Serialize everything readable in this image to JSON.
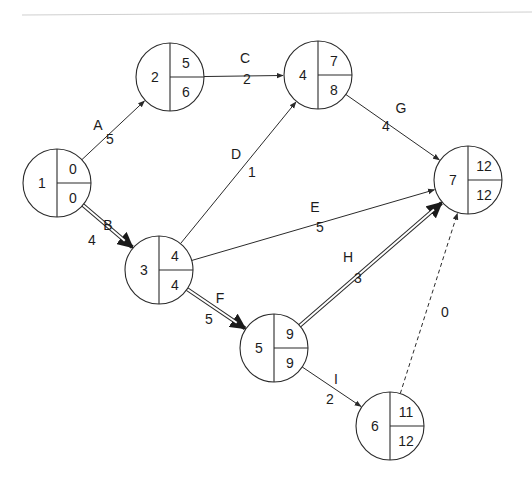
{
  "diagram": {
    "type": "activity-on-arrow network (critical path)",
    "colors": {
      "line": "#2a2a2a",
      "background": "#ffffff",
      "rule": "#cfcfcf"
    },
    "nodes": [
      {
        "id": "1",
        "label": "1",
        "earliest": "0",
        "latest": "0",
        "cx": 57,
        "cy": 183
      },
      {
        "id": "2",
        "label": "2",
        "earliest": "5",
        "latest": "6",
        "cx": 170,
        "cy": 77
      },
      {
        "id": "3",
        "label": "3",
        "earliest": "4",
        "latest": "4",
        "cx": 159,
        "cy": 270
      },
      {
        "id": "4",
        "label": "4",
        "earliest": "7",
        "latest": "8",
        "cx": 318,
        "cy": 75
      },
      {
        "id": "5",
        "label": "5",
        "earliest": "9",
        "latest": "9",
        "cx": 274,
        "cy": 348
      },
      {
        "id": "6",
        "label": "6",
        "earliest": "11",
        "latest": "12",
        "cx": 390,
        "cy": 426
      },
      {
        "id": "7",
        "label": "7",
        "earliest": "12",
        "latest": "12",
        "cx": 468,
        "cy": 180
      }
    ],
    "edges": [
      {
        "activity": "A",
        "duration": "5",
        "from": "1",
        "to": "2",
        "style": "normal"
      },
      {
        "activity": "B",
        "duration": "4",
        "from": "1",
        "to": "3",
        "style": "critical"
      },
      {
        "activity": "C",
        "duration": "2",
        "from": "2",
        "to": "4",
        "style": "normal"
      },
      {
        "activity": "D",
        "duration": "1",
        "from": "3",
        "to": "4",
        "style": "normal"
      },
      {
        "activity": "E",
        "duration": "5",
        "from": "3",
        "to": "7",
        "style": "normal"
      },
      {
        "activity": "F",
        "duration": "5",
        "from": "3",
        "to": "5",
        "style": "critical"
      },
      {
        "activity": "G",
        "duration": "4",
        "from": "4",
        "to": "7",
        "style": "normal"
      },
      {
        "activity": "H",
        "duration": "3",
        "from": "5",
        "to": "7",
        "style": "critical"
      },
      {
        "activity": "I",
        "duration": "2",
        "from": "5",
        "to": "6",
        "style": "normal"
      },
      {
        "activity": "",
        "duration": "0",
        "from": "6",
        "to": "7",
        "style": "dummy"
      }
    ]
  }
}
